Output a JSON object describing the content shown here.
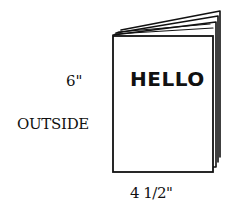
{
  "diagram": {
    "cover_text": "HELLO",
    "view_label": "OUTSIDE",
    "height_label": "6\"",
    "width_label": "4 1/2\"",
    "line_color": "#111111",
    "background_color": "#ffffff"
  }
}
